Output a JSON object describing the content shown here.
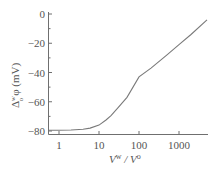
{
  "chart_data": {
    "type": "line",
    "title": "",
    "xlabel": "V^w / V^o",
    "ylabel": "Δ_o^w φ (mV)",
    "xscale": "log",
    "xlim": [
      0.5,
      5000
    ],
    "ylim": [
      -82,
      0
    ],
    "grid": false,
    "legend": null,
    "x_ticks": [
      1,
      10,
      100,
      1000
    ],
    "x_tick_labels": [
      "1",
      "10",
      "100",
      "1000"
    ],
    "y_ticks": [
      0,
      -20,
      -40,
      -60,
      -80
    ],
    "y_tick_labels": [
      "0",
      "−20",
      "−40",
      "−60",
      "−80"
    ],
    "series": [
      {
        "name": "potential",
        "x": [
          0.5,
          1,
          2,
          4,
          6,
          10,
          15,
          20,
          30,
          50,
          100,
          200,
          500,
          1000,
          2000,
          5000
        ],
        "y": [
          -79.5,
          -79.5,
          -79.3,
          -78.8,
          -78,
          -76,
          -72.5,
          -69.5,
          -64,
          -57,
          -43,
          -37,
          -28,
          -21,
          -14,
          -4
        ]
      }
    ],
    "color": "#7a7a7a"
  },
  "labels": {
    "y_axis_main": "Δ",
    "y_axis_sup": "w",
    "y_axis_sub": "o",
    "y_axis_rest": "φ (mV)",
    "x_axis": "V",
    "x_axis_sup1": "w",
    "x_axis_mid": " / V",
    "x_axis_sup2": "o"
  }
}
